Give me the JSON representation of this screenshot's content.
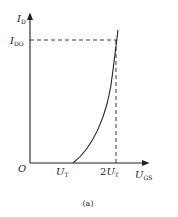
{
  "figure": {
    "caption": "(a)",
    "colors": {
      "line": "#222222",
      "background": "#ffffff"
    }
  },
  "axes": {
    "y_label_main": "I",
    "y_label_sub": "D",
    "x_label_main": "U",
    "x_label_sub": "GS",
    "origin_label": "O"
  },
  "ticks": {
    "ido_main": "I",
    "ido_sub": "DO",
    "ut_main": "U",
    "ut_sub": "T",
    "two_ut_prefix": "2",
    "two_ut_main": "U",
    "two_ut_sub": "T"
  }
}
